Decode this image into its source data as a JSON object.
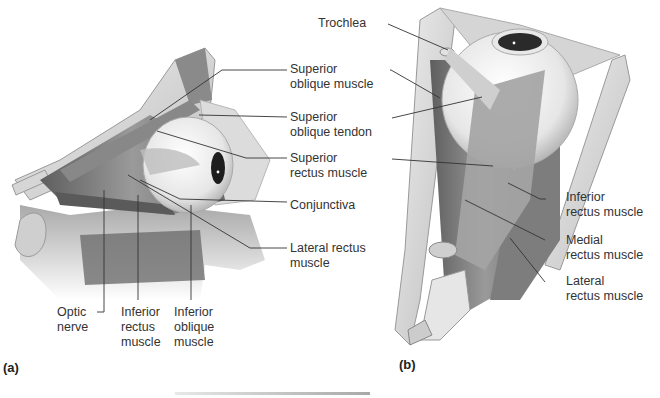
{
  "figure": {
    "panel_a": {
      "panel_label": "(a)",
      "labels": {
        "superior_oblique_muscle": [
          "Superior",
          "oblique muscle"
        ],
        "superior_oblique_tendon": [
          "Superior",
          "oblique tendon"
        ],
        "superior_rectus_muscle": [
          "Superior",
          "rectus muscle"
        ],
        "conjunctiva": [
          "Conjunctiva"
        ],
        "lateral_rectus_muscle": [
          "Lateral rectus",
          "muscle"
        ],
        "optic_nerve": [
          "Optic",
          "nerve"
        ],
        "inferior_rectus_muscle": [
          "Inferior",
          "rectus",
          "muscle"
        ],
        "inferior_oblique_muscle": [
          "Inferior",
          "oblique",
          "muscle"
        ]
      }
    },
    "panel_b": {
      "panel_label": "(b)",
      "labels": {
        "trochlea": [
          "Trochlea"
        ],
        "inferior_rectus_muscle": [
          "Inferior",
          "rectus muscle"
        ],
        "medial_rectus_muscle": [
          "Medial",
          "rectus muscle"
        ],
        "lateral_rectus_muscle": [
          "Lateral",
          "rectus muscle"
        ]
      }
    }
  },
  "colors": {
    "bone": "#d8d8d8",
    "muscle": "#7a7a7a",
    "eyeball": "#f2f2f2",
    "leader_line": "#333333"
  }
}
